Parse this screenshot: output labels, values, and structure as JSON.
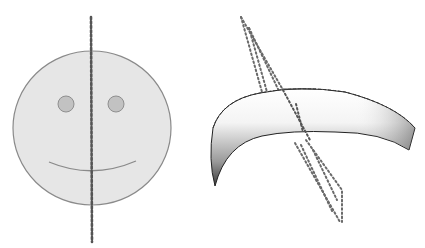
{
  "figures": [
    {
      "id": "smiley",
      "description": "Smiley face with vertical dotted line of symmetry",
      "face": {
        "cx": 92,
        "cy": 128,
        "rx": 79,
        "ry": 77,
        "fill": "#e6e6e6",
        "stroke": "#8a8a8a"
      },
      "eyes": [
        {
          "cx": 66,
          "cy": 104,
          "r": 8
        },
        {
          "cx": 116,
          "cy": 104,
          "r": 8
        }
      ],
      "eye_fill": "#c0c0c0",
      "mouth": "M 49 162 Q 92 180 136 161",
      "symmetry_line": {
        "x1": 91,
        "y1": 17,
        "x2": 92,
        "y2": 242
      }
    },
    {
      "id": "curved-solid",
      "description": "Curved 3D shape with slanted dotted plane (no line of symmetry)",
      "plane": [
        "M 241 16 L 265 93 L 282 97 L 245 27 Z",
        "M 262 92 L 336 223 L 342 189 L 297 138"
      ]
    }
  ]
}
